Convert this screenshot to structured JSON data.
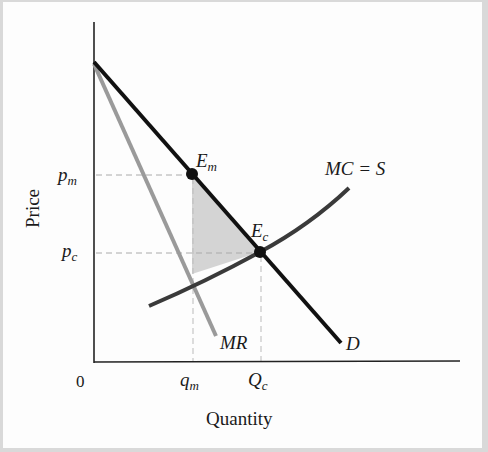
{
  "diagram": {
    "type": "monopoly-vs-competition-welfare-loss",
    "axes": {
      "x_label": "Quantity",
      "y_label": "Price",
      "origin_label": "0"
    },
    "price_ticks": [
      {
        "main": "p",
        "sub": "m"
      },
      {
        "main": "p",
        "sub": "c"
      }
    ],
    "quantity_ticks": [
      {
        "main": "q",
        "sub": "m"
      },
      {
        "main": "Q",
        "sub": "c"
      }
    ],
    "curves": {
      "demand": {
        "label": "D",
        "color": "#111111"
      },
      "marginal_revenue": {
        "label": "MR",
        "color": "#9a9a9a"
      },
      "marginal_cost": {
        "label": "MC = S",
        "color": "#333333"
      }
    },
    "points": {
      "monopoly_eq": {
        "main": "E",
        "sub": "m"
      },
      "competitive_eq": {
        "main": "E",
        "sub": "c"
      }
    },
    "deadweight_loss_fill": "#c8c8c8"
  }
}
